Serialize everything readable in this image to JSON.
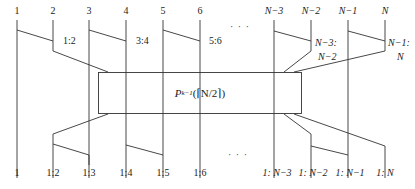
{
  "diagram": {
    "type": "recursive merge / comparator network",
    "top_inputs": [
      {
        "label": "1",
        "x": 17
      },
      {
        "label": "2",
        "x": 53
      },
      {
        "label": "3",
        "x": 89
      },
      {
        "label": "4",
        "x": 126
      },
      {
        "label": "5",
        "x": 163
      },
      {
        "label": "6",
        "x": 200
      },
      {
        "label": "N−3",
        "x": 274
      },
      {
        "label": "N−2",
        "x": 311
      },
      {
        "label": "N−1",
        "x": 348
      },
      {
        "label": "N",
        "x": 385
      }
    ],
    "top_comparators": [
      {
        "label": "1:2"
      },
      {
        "label": "3:4"
      },
      {
        "label": "5:6"
      },
      {
        "label_line1": "N−3:",
        "label_line2": "N−2"
      },
      {
        "label_line1": "N−1:",
        "label_line2": "N"
      }
    ],
    "ellipsis": "· · ·",
    "box": {
      "label_main": "P",
      "label_sub": "k−1",
      "label_arg": "(⌈N/2⌉)"
    },
    "bottom_outputs": [
      {
        "label": "1"
      },
      {
        "label": "1:2"
      },
      {
        "label": "1:3"
      },
      {
        "label": "1:4"
      },
      {
        "label": "1:5"
      },
      {
        "label": "1:6"
      },
      {
        "label": "1: N−3"
      },
      {
        "label": "1: N−2"
      },
      {
        "label": "1: N−1"
      },
      {
        "label": "1: N"
      }
    ],
    "colors": {
      "line": "#333333",
      "background": "#ffffff"
    }
  }
}
